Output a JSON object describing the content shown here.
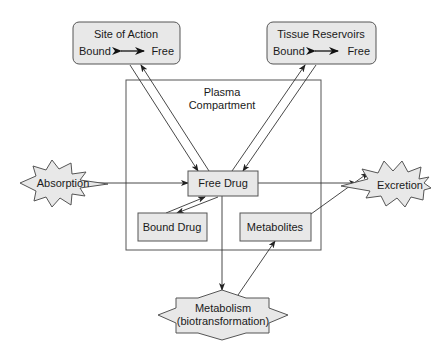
{
  "diagram": {
    "type": "pharmacokinetics-flow",
    "nodes": {
      "site_of_action": {
        "title": "Site of Action",
        "left": "Bound",
        "right": "Free"
      },
      "tissue_reservoirs": {
        "title": "Tissue Reservoirs",
        "left": "Bound",
        "right": "Free"
      },
      "plasma": {
        "line1": "Plasma",
        "line2": "Compartment"
      },
      "free_drug": {
        "label": "Free Drug"
      },
      "bound_drug": {
        "label": "Bound Drug"
      },
      "metabolites": {
        "label": "Metabolites"
      },
      "absorption": {
        "label": "Absorption"
      },
      "excretion": {
        "label": "Excretion"
      },
      "metabolism": {
        "line1": "Metabolism",
        "line2": "(biotransformation)"
      }
    },
    "edges": [
      {
        "from": "absorption",
        "to": "free_drug"
      },
      {
        "from": "free_drug",
        "to": "excretion"
      },
      {
        "from": "free_drug",
        "to": "site_of_action",
        "bidirectional": true
      },
      {
        "from": "free_drug",
        "to": "tissue_reservoirs",
        "bidirectional": true
      },
      {
        "from": "free_drug",
        "to": "bound_drug",
        "bidirectional": true
      },
      {
        "from": "free_drug",
        "to": "metabolism"
      },
      {
        "from": "metabolism",
        "to": "metabolites"
      },
      {
        "from": "metabolites",
        "to": "excretion"
      }
    ],
    "colors": {
      "fill": "#e8e8e8",
      "stroke": "#555555",
      "text": "#1a1a1a",
      "background": "#ffffff"
    }
  }
}
